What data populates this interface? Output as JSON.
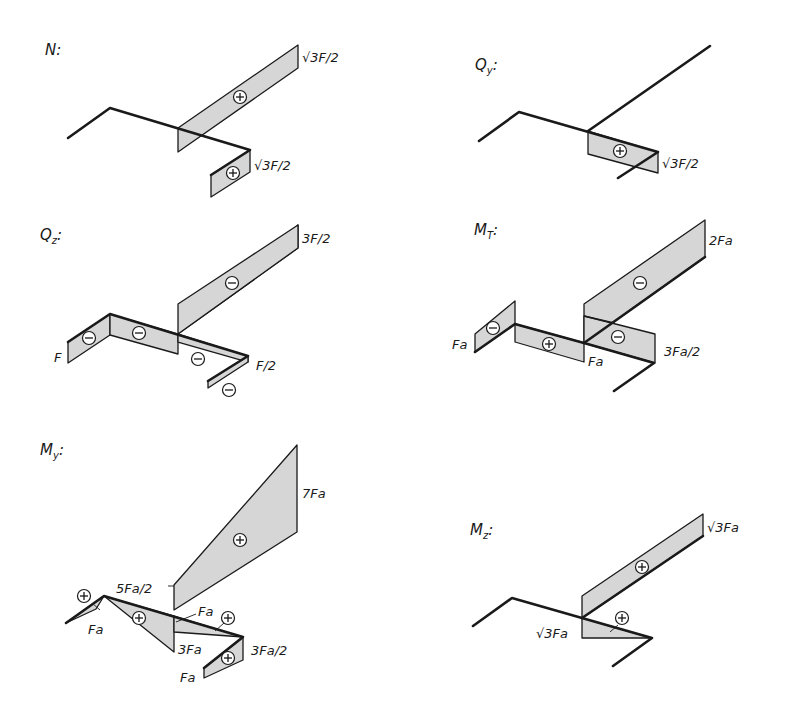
{
  "diagrams": [
    {
      "id": "N",
      "title": "N:",
      "title_main": "N",
      "title_sub": "",
      "values": [
        "√3F/2",
        "√3F/2"
      ],
      "signs": [
        "+",
        "+"
      ]
    },
    {
      "id": "Qy",
      "title": "Qy:",
      "title_main": "Q",
      "title_sub": "y",
      "values": [
        "√3F/2"
      ],
      "signs": [
        "+"
      ]
    },
    {
      "id": "Qz",
      "title": "Qz:",
      "title_main": "Q",
      "title_sub": "z",
      "values": [
        "3F/2",
        "F",
        "F/2"
      ],
      "signs": [
        "−",
        "−",
        "−",
        "−",
        "−"
      ]
    },
    {
      "id": "MT",
      "title": "MT:",
      "title_main": "M",
      "title_sub": "T",
      "values": [
        "2Fa",
        "Fa",
        "Fa",
        "3Fa/2"
      ],
      "signs": [
        "−",
        "+",
        "−",
        "−"
      ]
    },
    {
      "id": "My",
      "title": "My:",
      "title_main": "M",
      "title_sub": "y",
      "values": [
        "7Fa",
        "5Fa/2",
        "Fa",
        "Fa",
        "3Fa",
        "3Fa/2",
        "Fa"
      ],
      "signs": [
        "+",
        "+",
        "+",
        "+",
        "+"
      ]
    },
    {
      "id": "Mz",
      "title": "Mz:",
      "title_main": "M",
      "title_sub": "z",
      "values": [
        "√3Fa",
        "√3Fa"
      ],
      "signs": [
        "+",
        "+"
      ]
    }
  ],
  "colors": {
    "fill": "#d6d6d6",
    "line": "#1a1a1a",
    "background": "#ffffff"
  }
}
